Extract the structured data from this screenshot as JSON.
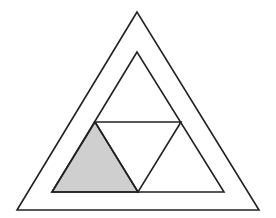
{
  "diagram": {
    "colors": {
      "background": "#ffffff",
      "stroke": "#222222",
      "shade": "#cfcfcf"
    },
    "outer_triangle": {
      "points": [
        [
          137,
          12
        ],
        [
          17,
          210
        ],
        [
          259,
          210
        ]
      ]
    },
    "inner_triangle": {
      "points": [
        [
          137,
          52
        ],
        [
          52,
          192
        ],
        [
          224,
          192
        ]
      ]
    },
    "midpoints": {
      "left": [
        95,
        122
      ],
      "right": [
        181,
        122
      ],
      "bottom": [
        138,
        192
      ]
    },
    "shaded_region": {
      "name": "bottom-left-subtriangle",
      "points": [
        [
          95,
          122
        ],
        [
          52,
          192
        ],
        [
          138,
          192
        ]
      ]
    }
  }
}
